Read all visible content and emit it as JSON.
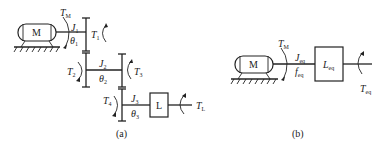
{
  "figure": {
    "panel_a": {
      "caption": "(a)",
      "motor_label": "M",
      "load_label": "L",
      "torques": {
        "motor": {
          "sym": "T",
          "sub": "M"
        },
        "t1": {
          "sym": "T",
          "sub": "1"
        },
        "t2": {
          "sym": "T",
          "sub": "2"
        },
        "t3": {
          "sym": "T",
          "sub": "3"
        },
        "t4": {
          "sym": "T",
          "sub": "4"
        },
        "load": {
          "sym": "T",
          "sub": "L"
        }
      },
      "shafts": [
        {
          "inertia": {
            "sym": "J",
            "sub": "1"
          },
          "angle": {
            "sym": "θ",
            "sub": "1"
          }
        },
        {
          "inertia": {
            "sym": "J",
            "sub": "2"
          },
          "angle": {
            "sym": "θ",
            "sub": "2"
          }
        },
        {
          "inertia": {
            "sym": "J",
            "sub": "3"
          },
          "angle": {
            "sym": "θ",
            "sub": "3"
          }
        }
      ]
    },
    "panel_b": {
      "caption": "(b)",
      "motor_label": "M",
      "load_label": {
        "sym": "L",
        "sub": "eq"
      },
      "motor_torque": {
        "sym": "T",
        "sub": "M"
      },
      "inertia": {
        "sym": "J",
        "sub": "eq"
      },
      "friction": {
        "sym": "f",
        "sub": "eq"
      },
      "load_torque": {
        "sym": "T",
        "sub": "eq"
      }
    }
  }
}
